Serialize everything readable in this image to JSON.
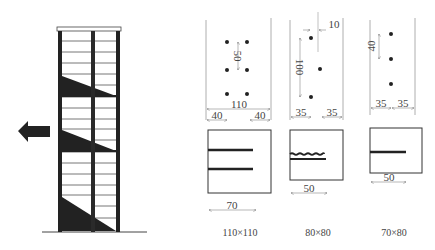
{
  "elevation": {
    "arrow_direction": "left",
    "hatch_color": "#222222",
    "line_color": "#333333"
  },
  "sections": [
    {
      "id": "section-110",
      "top_dims": {
        "total": "110",
        "left_edge": "40",
        "right_edge": "40",
        "spacing": "50"
      },
      "plate": {
        "length_dim": "70",
        "weld_lines": 2,
        "weld_style": "straight"
      },
      "caption": "110×110"
    },
    {
      "id": "section-80",
      "top_dims": {
        "left_edge": "35",
        "right_edge": "35",
        "spacing": "100",
        "offset": "10"
      },
      "plate": {
        "length_dim": "50",
        "weld_lines": 2,
        "weld_style": "wavy+straight"
      },
      "caption": "80×80"
    },
    {
      "id": "section-70",
      "top_dims": {
        "left_edge": "35",
        "right_edge": "35",
        "spacing": "40"
      },
      "plate": {
        "length_dim": "50",
        "weld_lines": 1,
        "weld_style": "straight"
      },
      "caption": "70×80"
    }
  ]
}
